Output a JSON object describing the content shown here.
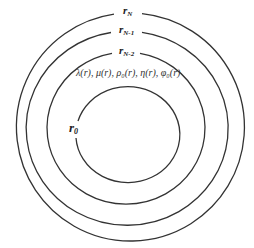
{
  "diagram": {
    "type": "concentric-layers",
    "stroke_color": "#333333",
    "background": "#ffffff",
    "layers": [
      {
        "label_base": "r",
        "label_sub": "N",
        "cx": 130,
        "cy": 127,
        "rx": 114,
        "ry": 114
      },
      {
        "label_base": "r",
        "label_sub": "N-1",
        "cx": 126,
        "cy": 128,
        "rx": 101,
        "ry": 97
      },
      {
        "label_base": "r",
        "label_sub": "N-2",
        "cx": 126,
        "cy": 128,
        "rx": 79,
        "ry": 76
      },
      {
        "label_base": "r",
        "label_sub": "0",
        "cx": 127,
        "cy": 133,
        "rx": 52,
        "ry": 48
      }
    ],
    "properties_label": "λ(r), μ(r), ρ₀(r), η(r), φ₀(r)"
  }
}
